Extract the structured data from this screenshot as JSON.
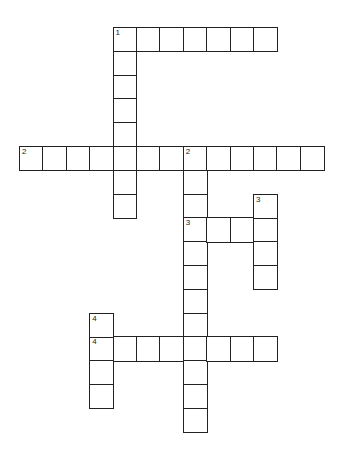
{
  "puzzle": {
    "type": "crossword",
    "grid": {
      "origin_x": 19,
      "origin_y": 27,
      "cell_w": 23.4,
      "cell_h": 23.8,
      "cols": 13,
      "rows": 17
    },
    "line_color": "#222222",
    "entries": [
      {
        "number": "1",
        "direction": "across",
        "row": 0,
        "col": 4,
        "length": 7
      },
      {
        "number": "1",
        "direction": "down",
        "row": 0,
        "col": 4,
        "length": 8
      },
      {
        "number": "2",
        "direction": "across",
        "row": 5,
        "col": 0,
        "length": 13
      },
      {
        "number": "2",
        "direction": "down",
        "row": 5,
        "col": 7,
        "length": 12
      },
      {
        "number": "3",
        "direction": "across",
        "row": 8,
        "col": 7,
        "length": 4
      },
      {
        "number": "3",
        "direction": "down",
        "row": 7,
        "col": 10,
        "length": 4
      },
      {
        "number": "4",
        "direction": "across",
        "row": 13,
        "col": 3,
        "length": 8
      },
      {
        "number": "4",
        "direction": "down",
        "row": 12,
        "col": 3,
        "length": 4
      }
    ]
  }
}
